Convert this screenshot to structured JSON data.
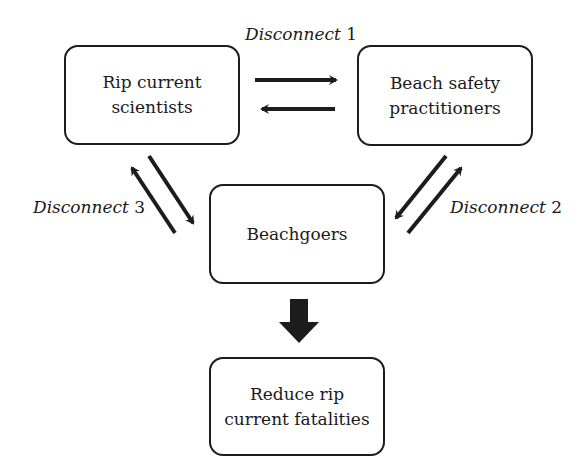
{
  "diagram": {
    "nodes": [
      {
        "id": "scientists",
        "line1": "Rip current",
        "line2": "scientists"
      },
      {
        "id": "practitioners",
        "line1": "Beach safety",
        "line2": "practitioners"
      },
      {
        "id": "beachgoers",
        "line1": "Beachgoers",
        "line2": ""
      },
      {
        "id": "outcome",
        "line1": "Reduce rip",
        "line2": "current fatalities"
      }
    ],
    "labels": {
      "disconnect1": {
        "word": "Disconnect",
        "number": "1"
      },
      "disconnect2": {
        "word": "Disconnect",
        "number": "2"
      },
      "disconnect3": {
        "word": "Disconnect",
        "number": "3"
      }
    },
    "edges": [
      {
        "from": "scientists",
        "to": "practitioners",
        "label": "Disconnect 1"
      },
      {
        "from": "practitioners",
        "to": "scientists",
        "label": "Disconnect 1"
      },
      {
        "from": "practitioners",
        "to": "beachgoers",
        "label": "Disconnect 2"
      },
      {
        "from": "beachgoers",
        "to": "practitioners",
        "label": "Disconnect 2"
      },
      {
        "from": "scientists",
        "to": "beachgoers",
        "label": "Disconnect 3"
      },
      {
        "from": "beachgoers",
        "to": "scientists",
        "label": "Disconnect 3"
      },
      {
        "from": "beachgoers",
        "to": "outcome",
        "label": ""
      }
    ],
    "colors": {
      "stroke": "#1c1c1c",
      "background": "#ffffff"
    }
  }
}
